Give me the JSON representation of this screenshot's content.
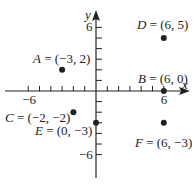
{
  "diagram": {
    "type": "coordinate-plane",
    "axes": {
      "x_label": "x",
      "y_label": "y",
      "x_range": [
        -7,
        7
      ],
      "y_range": [
        -7,
        7
      ],
      "x_tick_labels": [
        {
          "value": -6,
          "text": "−6"
        },
        {
          "value": 6,
          "text": "6"
        }
      ],
      "y_tick_labels": [
        {
          "value": 6,
          "text": "6"
        },
        {
          "value": -6,
          "text": "−6"
        }
      ]
    },
    "points": [
      {
        "name": "A",
        "x": -3,
        "y": 2,
        "label": "(−3, 2)"
      },
      {
        "name": "B",
        "x": 6,
        "y": 0,
        "label": "(6, 0)"
      },
      {
        "name": "C",
        "x": -2,
        "y": -2,
        "label": "(−2, −2)"
      },
      {
        "name": "D",
        "x": 6,
        "y": 5,
        "label": "(6, 5)"
      },
      {
        "name": "E",
        "x": 0,
        "y": -3,
        "label": "(0, −3)"
      },
      {
        "name": "F",
        "x": 6,
        "y": -3,
        "label": "(6, −3)"
      }
    ],
    "colors": {
      "ink": "#222222",
      "background": "#ffffff"
    }
  },
  "chart_data": {
    "type": "scatter",
    "title": "",
    "xlabel": "x",
    "ylabel": "y",
    "xlim": [
      -7,
      7
    ],
    "ylim": [
      -7,
      7
    ],
    "grid": false,
    "series": [
      {
        "name": "points",
        "values": [
          {
            "label": "A",
            "x": -3,
            "y": 2
          },
          {
            "label": "B",
            "x": 6,
            "y": 0
          },
          {
            "label": "C",
            "x": -2,
            "y": -2
          },
          {
            "label": "D",
            "x": 6,
            "y": 5
          },
          {
            "label": "E",
            "x": 0,
            "y": -3
          },
          {
            "label": "F",
            "x": 6,
            "y": -3
          }
        ]
      }
    ]
  }
}
